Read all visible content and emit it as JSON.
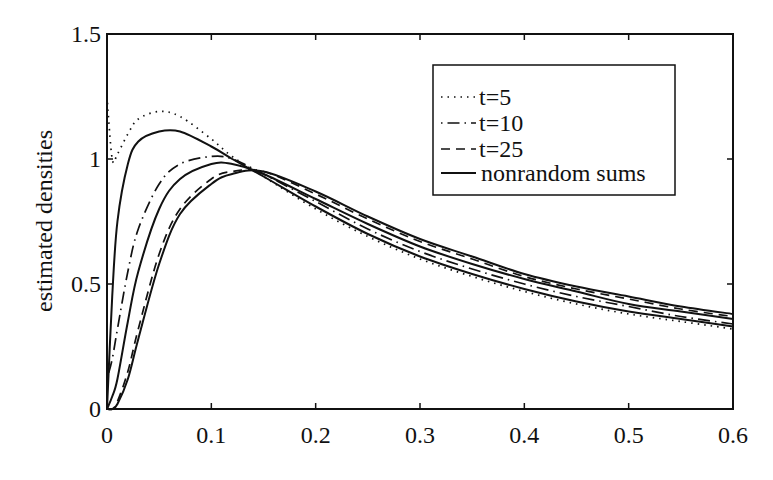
{
  "chart_data": {
    "type": "line",
    "title": "",
    "xlabel": "",
    "ylabel": "estimated densities",
    "xlim": [
      0,
      0.6
    ],
    "ylim": [
      0,
      1.5
    ],
    "grid": false,
    "legend_position": "upper right",
    "x_ticks": [
      "0",
      "0.1",
      "0.2",
      "0.3",
      "0.4",
      "0.5",
      "0.6"
    ],
    "y_ticks": [
      "0",
      "0.5",
      "1",
      "1.5"
    ],
    "legend": [
      "t=5",
      "t=10",
      "t=25",
      "nonrandom sums"
    ],
    "x": [
      0,
      0.005,
      0.01,
      0.02,
      0.03,
      0.05,
      0.07,
      0.1,
      0.12,
      0.15,
      0.2,
      0.25,
      0.3,
      0.35,
      0.4,
      0.45,
      0.5,
      0.55,
      0.6
    ],
    "series": [
      {
        "name": "t=5",
        "style": "dotted",
        "values": [
          1.25,
          1.0,
          1.02,
          1.1,
          1.16,
          1.19,
          1.17,
          1.08,
          1.01,
          0.93,
          0.8,
          0.69,
          0.6,
          0.53,
          0.47,
          0.42,
          0.38,
          0.35,
          0.32
        ]
      },
      {
        "name": "nonrandom sums (1)",
        "style": "solid",
        "values": [
          0.0,
          0.45,
          0.75,
          0.98,
          1.07,
          1.11,
          1.11,
          1.05,
          1.0,
          0.93,
          0.81,
          0.7,
          0.61,
          0.54,
          0.48,
          0.43,
          0.39,
          0.36,
          0.33
        ]
      },
      {
        "name": "t=10",
        "style": "dash-dot",
        "values": [
          0.12,
          0.2,
          0.32,
          0.55,
          0.72,
          0.9,
          0.98,
          1.01,
          1.0,
          0.94,
          0.83,
          0.72,
          0.63,
          0.56,
          0.5,
          0.45,
          0.41,
          0.37,
          0.34
        ]
      },
      {
        "name": "nonrandom sums (2)",
        "style": "solid",
        "values": [
          0.0,
          0.05,
          0.12,
          0.35,
          0.55,
          0.8,
          0.92,
          0.98,
          0.98,
          0.94,
          0.84,
          0.74,
          0.65,
          0.58,
          0.52,
          0.47,
          0.42,
          0.39,
          0.36
        ]
      },
      {
        "name": "t=25",
        "style": "dashed",
        "values": [
          0.0,
          0.0,
          0.03,
          0.15,
          0.32,
          0.62,
          0.8,
          0.92,
          0.95,
          0.95,
          0.86,
          0.76,
          0.67,
          0.6,
          0.53,
          0.48,
          0.44,
          0.4,
          0.37
        ]
      },
      {
        "name": "nonrandom sums (3)",
        "style": "solid",
        "values": [
          0.0,
          0.0,
          0.02,
          0.12,
          0.28,
          0.58,
          0.78,
          0.9,
          0.94,
          0.95,
          0.87,
          0.77,
          0.68,
          0.61,
          0.54,
          0.49,
          0.45,
          0.41,
          0.38
        ]
      }
    ]
  },
  "axes": {
    "ylabel": "estimated densities",
    "x_ticks": [
      "0",
      "0.1",
      "0.2",
      "0.3",
      "0.4",
      "0.5",
      "0.6"
    ],
    "y_ticks": [
      "0",
      "0.5",
      "1",
      "1.5"
    ]
  },
  "legend": {
    "items": [
      {
        "label": "t=5",
        "style": "dotted"
      },
      {
        "label": "t=10",
        "style": "dash-dot"
      },
      {
        "label": "t=25",
        "style": "dashed"
      },
      {
        "label": "nonrandom sums",
        "style": "solid"
      }
    ]
  },
  "colors": {
    "line": "#111111",
    "background": "#ffffff"
  }
}
